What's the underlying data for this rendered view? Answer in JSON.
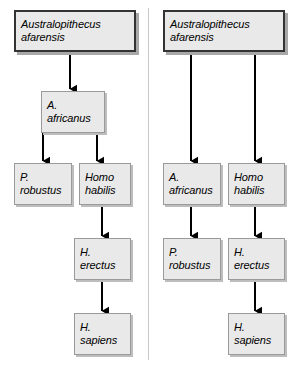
{
  "figure": {
    "type": "diagram",
    "subtype": "hominid-phylogeny-comparison",
    "panels": [
      {
        "id": "panel-left",
        "nodes": [
          {
            "id": "afarensis",
            "line1": "Australopithecus",
            "line2": "afarensis",
            "x": 14,
            "y": 10,
            "w": 122,
            "h": 42,
            "style": "root"
          },
          {
            "id": "africanus",
            "line1": "A.",
            "line2": "africanus",
            "x": 41,
            "y": 91,
            "w": 64,
            "h": 42,
            "style": "sub"
          },
          {
            "id": "robustus",
            "line1": "P.",
            "line2": "robustus",
            "x": 14,
            "y": 163,
            "w": 58,
            "h": 42,
            "style": "sub"
          },
          {
            "id": "habilis",
            "line1": "Homo",
            "line2": "habilis",
            "x": 79,
            "y": 163,
            "w": 52,
            "h": 42,
            "style": "sub"
          },
          {
            "id": "erectus",
            "line1": "H.",
            "line2": "erectus",
            "x": 74,
            "y": 238,
            "w": 57,
            "h": 42,
            "style": "sub"
          },
          {
            "id": "sapiens",
            "line1": "H.",
            "line2": "sapiens",
            "x": 74,
            "y": 313,
            "w": 57,
            "h": 42,
            "style": "sub"
          }
        ],
        "arrows": [
          {
            "id": "afarensis-to-africanus",
            "x1": 70,
            "y1": 52,
            "x2": 70,
            "y2": 89
          },
          {
            "id": "africanus-to-robustus",
            "x1": 43,
            "y1": 133,
            "x2": 43,
            "y2": 161,
            "elbow_from_x": 70
          },
          {
            "id": "africanus-to-habilis",
            "x1": 97,
            "y1": 133,
            "x2": 97,
            "y2": 161
          },
          {
            "id": "habilis-to-erectus",
            "x1": 102,
            "y1": 205,
            "x2": 102,
            "y2": 236
          },
          {
            "id": "erectus-to-sapiens",
            "x1": 102,
            "y1": 280,
            "x2": 102,
            "y2": 311
          }
        ]
      },
      {
        "id": "panel-right",
        "nodes": [
          {
            "id": "afarensis",
            "line1": "Australopithecus",
            "line2": "afarensis",
            "x": 163,
            "y": 10,
            "w": 122,
            "h": 42,
            "style": "root"
          },
          {
            "id": "africanus",
            "line1": "A.",
            "line2": "africanus",
            "x": 163,
            "y": 163,
            "w": 58,
            "h": 42,
            "style": "sub"
          },
          {
            "id": "habilis",
            "line1": "Homo",
            "line2": "habilis",
            "x": 228,
            "y": 163,
            "w": 57,
            "h": 42,
            "style": "sub"
          },
          {
            "id": "robustus",
            "line1": "P.",
            "line2": "robustus",
            "x": 163,
            "y": 238,
            "w": 58,
            "h": 42,
            "style": "sub"
          },
          {
            "id": "erectus",
            "line1": "H.",
            "line2": "erectus",
            "x": 228,
            "y": 238,
            "w": 57,
            "h": 42,
            "style": "sub"
          },
          {
            "id": "sapiens",
            "line1": "H.",
            "line2": "sapiens",
            "x": 228,
            "y": 313,
            "w": 57,
            "h": 42,
            "style": "sub"
          }
        ],
        "arrows": [
          {
            "id": "afarensis-to-africanus",
            "x1": 191,
            "y1": 52,
            "x2": 191,
            "y2": 161
          },
          {
            "id": "afarensis-to-habilis",
            "x1": 255,
            "y1": 52,
            "x2": 255,
            "y2": 161
          },
          {
            "id": "africanus-to-robustus",
            "x1": 191,
            "y1": 205,
            "x2": 191,
            "y2": 236
          },
          {
            "id": "habilis-to-erectus",
            "x1": 255,
            "y1": 205,
            "x2": 255,
            "y2": 236
          },
          {
            "id": "erectus-to-sapiens",
            "x1": 255,
            "y1": 280,
            "x2": 255,
            "y2": 311
          }
        ]
      }
    ],
    "divider": {
      "id": "panel-divider",
      "x": 148,
      "y": 8,
      "height": 352
    },
    "colors": {
      "box_fill": "#e9e9e9",
      "root_border": "#333333",
      "sub_border": "#9a9a9a",
      "shadow": "#b0b0b0",
      "arrow": "#000000",
      "divider": "#c8c8c8",
      "background": "#ffffff",
      "text": "#000000"
    }
  }
}
